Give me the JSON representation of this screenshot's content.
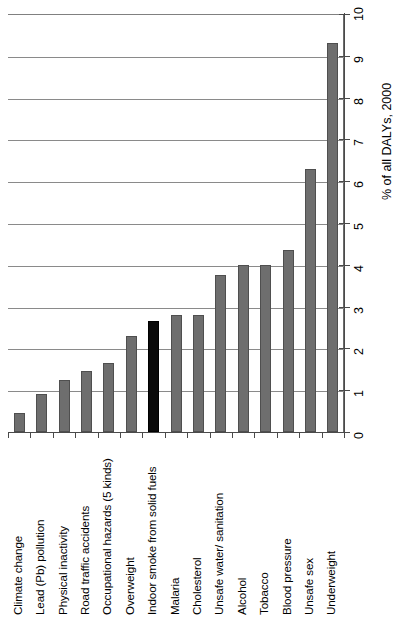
{
  "chart_data": {
    "type": "bar",
    "title": "",
    "subtitle": "",
    "orientation": "vertical-bars-with-rotated-labels",
    "xlabel": "",
    "ylabel": "% of all DALYs, 2000",
    "ylim": [
      0,
      10
    ],
    "ytick_step": 1,
    "grid": "horizontal",
    "legend": "none",
    "highlight_category": "Indoor smoke from solid fuels",
    "highlight_color": "#0a0a0a",
    "bar_color": "#6e6e6e",
    "categories": [
      "Climate change",
      "Lead (Pb) pollution",
      "Physical inactivity",
      "Road traffic accidents",
      "Occupational hazards (5 kinds)",
      "Overweight",
      "Indoor smoke from solid fuels",
      "Malaria",
      "Cholesterol",
      "Unsafe water/ sanitation",
      "Alcohol",
      "Tobacco",
      "Blood pressure",
      "Unsafe sex",
      "Underweight"
    ],
    "values": [
      0.45,
      0.9,
      1.25,
      1.45,
      1.65,
      2.3,
      2.65,
      2.8,
      2.8,
      3.75,
      4.0,
      4.0,
      4.35,
      6.3,
      9.3
    ],
    "ytick_labels": [
      "0",
      "1",
      "2",
      "3",
      "4",
      "5",
      "6",
      "7",
      "8",
      "9",
      "10"
    ],
    "ytick_values": [
      0,
      1,
      2,
      3,
      4,
      5,
      6,
      7,
      8,
      9,
      10
    ]
  }
}
